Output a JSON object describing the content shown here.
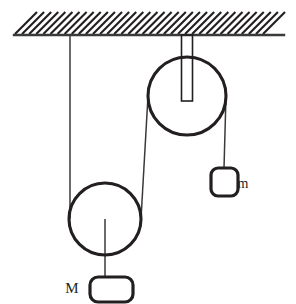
{
  "figure": {
    "type": "physics-free-body-diagram",
    "background_color": "#ffffff",
    "stroke_color": "#231f20",
    "thin_stroke_color": "#3a3a3a"
  },
  "ceiling": {
    "name": "ceiling-support",
    "line_y": 35,
    "line_x_start": 14,
    "line_x_end": 284,
    "hatch_count": 36,
    "hatch_angle_label": "45",
    "hatch_height": 22
  },
  "pulleys": [
    {
      "id": "upper-pulley",
      "role": "fixed",
      "center_x": 187,
      "center_y": 96,
      "radius": 39,
      "has_bracket": true,
      "bracket_width": 11,
      "bracket_top_y": 35,
      "bracket_bottom_y": 101
    },
    {
      "id": "lower-pulley",
      "role": "movable",
      "center_x": 105,
      "center_y": 219,
      "radius": 36,
      "has_bracket": false
    }
  ],
  "ropes": [
    {
      "id": "rope-ceiling-to-lower-pulley",
      "from": "ceiling",
      "to": "lower-pulley-left",
      "x1": 70,
      "y1": 36,
      "x2": 70,
      "y2": 219
    },
    {
      "id": "rope-upper-left-to-lower-right",
      "from": "upper-pulley-left",
      "to": "lower-pulley-right",
      "x1": 148,
      "y1": 96,
      "x2": 141,
      "y2": 219
    },
    {
      "id": "rope-upper-right-to-mass-m",
      "from": "upper-pulley-right",
      "to": "mass-m",
      "x1": 226,
      "y1": 96,
      "x2": 224,
      "y2": 168
    },
    {
      "id": "rope-lower-pulley-to-mass-M",
      "from": "lower-pulley-center",
      "to": "mass-M",
      "x1": 105,
      "y1": 219,
      "x2": 105,
      "y2": 278
    }
  ],
  "masses": [
    {
      "id": "mass-M",
      "label": "M",
      "label_x": 72,
      "label_y": 293,
      "label_font_size": 15,
      "block_x": 90,
      "block_y": 277,
      "block_width": 43,
      "block_height": 25,
      "corner_radius": 8
    },
    {
      "id": "mass-m",
      "label": "m",
      "label_x": 243,
      "label_y": 188,
      "label_font_size": 14,
      "block_x": 211,
      "block_y": 168,
      "block_width": 27,
      "block_height": 28,
      "corner_radius": 7
    }
  ]
}
